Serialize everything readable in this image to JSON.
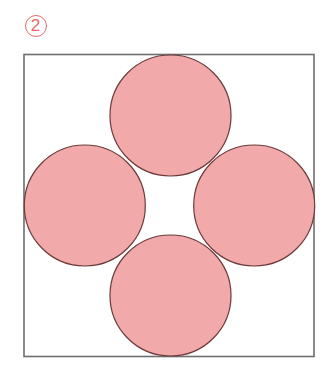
{
  "figure": {
    "label": {
      "text": "2",
      "center": [
        35.5,
        25.5
      ],
      "radius": 11,
      "color": "#e86a6a",
      "font_size": 17,
      "ring_width": 1.5
    },
    "square": {
      "x": 24,
      "y": 54.5,
      "width": 290,
      "height": 302,
      "stroke": "#6e6e6e",
      "stroke_width": 1.6,
      "fill": "#ffffff"
    },
    "circle_style": {
      "fill": "#f2a9a9",
      "stroke": "#6b3a3a",
      "stroke_width": 1.2
    },
    "circles": [
      {
        "id": "top",
        "cx": 170.5,
        "cy": 115.5,
        "r": 60.5
      },
      {
        "id": "left",
        "cx": 84.8,
        "cy": 205.5,
        "r": 60.5
      },
      {
        "id": "right",
        "cx": 254.2,
        "cy": 205.5,
        "r": 60.5
      },
      {
        "id": "bottom",
        "cx": 170.5,
        "cy": 295.5,
        "r": 60.5
      }
    ]
  }
}
